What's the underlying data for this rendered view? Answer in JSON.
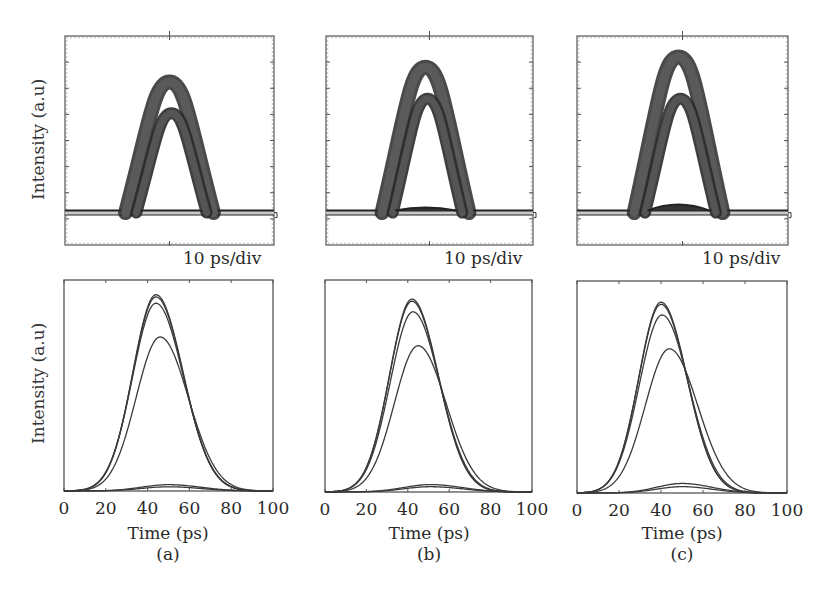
{
  "figure": {
    "panels": [
      "(a)",
      "(b)",
      "(c)"
    ],
    "top_row": {
      "ylabel": "Intensity (a.u)",
      "scale_label": "10 ps/div"
    },
    "bottom_row": {
      "ylabel": "Intensity (a.u)",
      "xlabel": "Time (ps)",
      "xticks": [
        "0",
        "20",
        "40",
        "60",
        "80",
        "100"
      ]
    }
  },
  "colors": {
    "axis": "#555555",
    "trace": "#3a3a3a",
    "eye_band": "#4a4a4a",
    "baseline_fill": "#c8c8c8"
  },
  "chart_data": [
    {
      "type": "line",
      "title": "(a) measured oscilloscope trace",
      "xlabel": "",
      "ylabel": "Intensity (a.u)",
      "scale": "10 ps/div",
      "grid": false,
      "description": "Eye-diagram style persistence trace: single broad pulse band with bright baseline",
      "bands": [
        {
          "center_div": 5,
          "peak_level": 0.78,
          "inner_peak_level": 0.63
        }
      ]
    },
    {
      "type": "line",
      "title": "(b) measured oscilloscope trace",
      "xlabel": "",
      "ylabel": "Intensity (a.u)",
      "scale": "10 ps/div",
      "grid": false,
      "description": "Two overlapping pulse bands",
      "bands": [
        {
          "center_div": 5,
          "peak_level": 0.85,
          "inner_peak_level": 0.7
        }
      ]
    },
    {
      "type": "line",
      "title": "(c) measured oscilloscope trace",
      "xlabel": "",
      "ylabel": "Intensity (a.u)",
      "scale": "10 ps/div",
      "grid": false,
      "description": "Two separated pulse bands, higher upper band",
      "bands": [
        {
          "center_div": 5,
          "peak_level": 0.9,
          "inner_peak_level": 0.7
        }
      ]
    },
    {
      "type": "line",
      "title": "(a) simulated",
      "xlabel": "Time (ps)",
      "ylabel": "Intensity (a.u)",
      "xlim": [
        0,
        100
      ],
      "ylim": [
        0,
        1
      ],
      "x_ticks": [
        0,
        20,
        40,
        60,
        80,
        100
      ],
      "grid": false,
      "series": [
        {
          "name": "pulse 1",
          "center": 44,
          "sigma": 12.0,
          "peak": 0.93
        },
        {
          "name": "pulse 2",
          "center": 44,
          "sigma": 12.0,
          "peak": 0.92
        },
        {
          "name": "pulse 3",
          "center": 44,
          "sigma": 12.2,
          "peak": 0.89
        },
        {
          "name": "pulse 4",
          "center": 46,
          "sigma": 12.5,
          "peak": 0.73
        },
        {
          "name": "low level 1",
          "center": 50,
          "sigma": 14,
          "peak": 0.03
        },
        {
          "name": "low level 2",
          "center": 50,
          "sigma": 14,
          "peak": 0.02
        }
      ]
    },
    {
      "type": "line",
      "title": "(b) simulated",
      "xlabel": "Time (ps)",
      "ylabel": "Intensity (a.u)",
      "xlim": [
        0,
        100
      ],
      "ylim": [
        0,
        1
      ],
      "x_ticks": [
        0,
        20,
        40,
        60,
        80,
        100
      ],
      "grid": false,
      "series": [
        {
          "name": "pulse 1",
          "center": 42,
          "sigma": 11.8,
          "peak": 0.91
        },
        {
          "name": "pulse 2",
          "center": 42,
          "sigma": 11.8,
          "peak": 0.9
        },
        {
          "name": "pulse 3",
          "center": 42.5,
          "sigma": 12.0,
          "peak": 0.85
        },
        {
          "name": "pulse 4",
          "center": 45,
          "sigma": 12.5,
          "peak": 0.69
        },
        {
          "name": "low level 1",
          "center": 51,
          "sigma": 14,
          "peak": 0.035
        },
        {
          "name": "low level 2",
          "center": 51,
          "sigma": 14,
          "peak": 0.025
        }
      ]
    },
    {
      "type": "line",
      "title": "(c) simulated",
      "xlabel": "Time (ps)",
      "ylabel": "Intensity (a.u)",
      "xlim": [
        0,
        100
      ],
      "ylim": [
        0,
        1
      ],
      "x_ticks": [
        0,
        20,
        40,
        60,
        80,
        100
      ],
      "grid": false,
      "series": [
        {
          "name": "pulse 1",
          "center": 40,
          "sigma": 11.5,
          "peak": 0.9
        },
        {
          "name": "pulse 2",
          "center": 40,
          "sigma": 11.5,
          "peak": 0.89
        },
        {
          "name": "pulse 3",
          "center": 40.5,
          "sigma": 11.8,
          "peak": 0.84
        },
        {
          "name": "pulse 4",
          "center": 44,
          "sigma": 12.5,
          "peak": 0.68
        },
        {
          "name": "low level 1",
          "center": 50,
          "sigma": 13,
          "peak": 0.045
        },
        {
          "name": "low level 2",
          "center": 50,
          "sigma": 13,
          "peak": 0.03
        }
      ]
    }
  ]
}
